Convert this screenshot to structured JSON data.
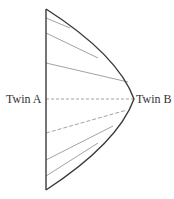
{
  "diagram": {
    "labels": {
      "twin_a": "Twin A",
      "twin_b": "Twin B"
    },
    "colors": {
      "worldline": "#3a3a3a",
      "dashed": "#8a8a8a",
      "text": "#333333",
      "background": "#ffffff"
    },
    "twin_a_worldline": {
      "x": 46,
      "y_top": 9,
      "y_bottom": 190
    },
    "twin_b_worldline": {
      "start": [
        46,
        9
      ],
      "apex": [
        134,
        99
      ],
      "end": [
        46,
        190
      ]
    },
    "simultaneity_lines": [
      {
        "from": [
          46,
          18
        ],
        "to": [
          70,
          28
        ]
      },
      {
        "from": [
          46,
          33
        ],
        "to": [
          98,
          58
        ]
      },
      {
        "from": [
          46,
          63
        ],
        "to": [
          128,
          82
        ]
      },
      {
        "from": [
          46,
          99
        ],
        "to": [
          134,
          99
        ]
      },
      {
        "from": [
          46,
          133
        ],
        "to": [
          127,
          110
        ]
      },
      {
        "from": [
          46,
          160
        ],
        "to": [
          113,
          126
        ]
      },
      {
        "from": [
          46,
          176
        ],
        "to": [
          98,
          143
        ]
      }
    ]
  }
}
